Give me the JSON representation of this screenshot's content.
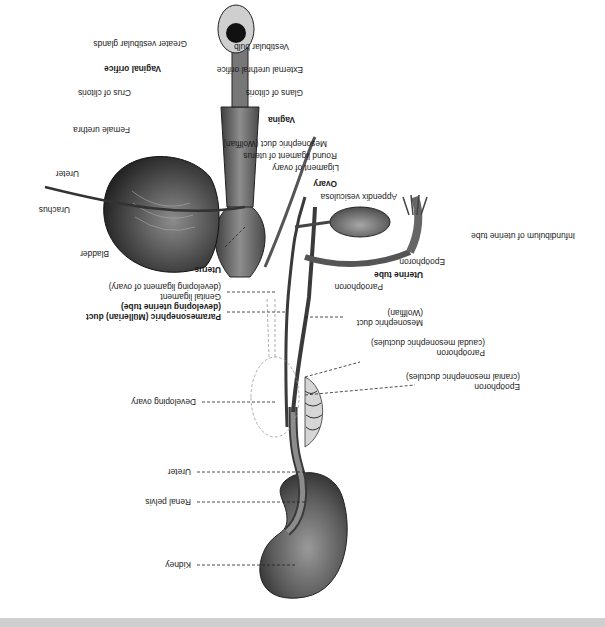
{
  "figure": {
    "orientation": "rotated 180 degrees",
    "background": "#ffffff",
    "footer_band_color": "#cfcfcf"
  },
  "labels": {
    "greater_vestibular_glands": "Greater vestibular glands",
    "vestibular_bulb": "Vestibular bulb",
    "vaginal_orifice": "Vaginal orifice",
    "external_urethral_orifice": "External urethral orifice",
    "crus_of_clitoris": "Crus of clitoris",
    "glans_of_clitoris": "Glans of clitoris",
    "vagina": "Vagina",
    "female_urethra": "Female urethra",
    "mesonephric_duct_wolffian_top": "Mesonephric duct (Wolffian)",
    "round_ligament_of_uterus": "Round ligament of uterus",
    "ureter_top": "Ureter",
    "ligament_of_ovary": "Ligament of ovary",
    "ovary": "Ovary",
    "urachus": "Urachus",
    "appendix_vesiculosa": "Appendix vesiculosa",
    "bladder": "Bladder",
    "infundibulum": "Infundibulum of uterine tube",
    "uterus": "Uterus",
    "epoophoron_top": "Epoöphoron",
    "uterine_tube": "Uterine tube",
    "paroophoron_top": "Paroöphoron",
    "genital_ligament_1": "Genital ligament",
    "genital_ligament_2": "(developing ligament of ovary)",
    "mesonephric_duct_1": "Mesonephric duct",
    "mesonephric_duct_2": "(Wolffian)",
    "paramesonephric_1": "Paramesonephric (Müllerian) duct",
    "paramesonephric_2": "(developing uterine tube)",
    "paroophoron_caudal_1": "Paroöphoron",
    "paroophoron_caudal_2": "(caudal mesonephric ductules)",
    "developing_ovary": "Developing ovary",
    "epoophoron_cranial_1": "Epoöphoron",
    "epoophoron_cranial_2": "(cranial mesonephric ductules)",
    "ureter_bottom": "Ureter",
    "renal_pelvis": "Renal pelvis",
    "kidney": "Kidney"
  }
}
